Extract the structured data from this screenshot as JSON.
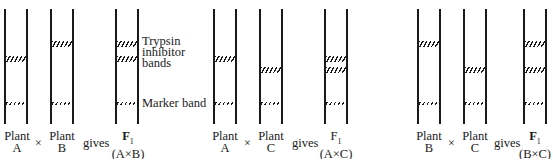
{
  "figure": {
    "annotations": {
      "trypsin_label": [
        "Trypsin",
        "inhibitor",
        "bands"
      ],
      "marker_label": "Marker band"
    },
    "crosses": [
      {
        "parent1": {
          "word": "Plant",
          "id": "A"
        },
        "operator": "×",
        "parent2": {
          "word": "Plant",
          "id": "B"
        },
        "gives": "gives",
        "offspring": {
          "word": "F",
          "sub": "1",
          "cross": "(A×B)"
        }
      },
      {
        "parent1": {
          "word": "Plant",
          "id": "A"
        },
        "operator": "×",
        "parent2": {
          "word": "Plant",
          "id": "C"
        },
        "gives": "gives",
        "offspring": {
          "word": "F",
          "sub": "1",
          "cross": "(A×C)"
        }
      },
      {
        "parent1": {
          "word": "Plant",
          "id": "B"
        },
        "operator": "×",
        "parent2": {
          "word": "Plant",
          "id": "C"
        },
        "gives": "gives",
        "offspring": {
          "word": "F",
          "sub": "1",
          "cross": "(B×C)"
        }
      }
    ],
    "lanes": [
      {
        "name": "A",
        "x": 4,
        "bands": [
          "A"
        ]
      },
      {
        "name": "B",
        "x": 50,
        "bands": [
          "B"
        ]
      },
      {
        "name": "F1 A×B",
        "x": 115,
        "bands": [
          "B",
          "A"
        ]
      },
      {
        "name": "A",
        "x": 213,
        "bands": [
          "A"
        ]
      },
      {
        "name": "C",
        "x": 259,
        "bands": [
          "C"
        ]
      },
      {
        "name": "F1 A×C",
        "x": 324,
        "bands": [
          "A",
          "C"
        ]
      },
      {
        "name": "B",
        "x": 417,
        "bands": [
          "B"
        ]
      },
      {
        "name": "C",
        "x": 463,
        "bands": [
          "C"
        ]
      },
      {
        "name": "F1 B×C",
        "x": 523,
        "bands": [
          "B",
          "C"
        ]
      }
    ],
    "band_positions_y": {
      "B": 41,
      "A": 56,
      "C": 68,
      "marker": 102
    }
  }
}
